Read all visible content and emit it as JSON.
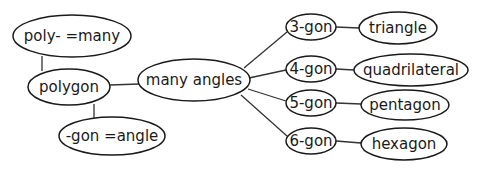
{
  "diagram": {
    "type": "concept-map",
    "nodes": {
      "poly_many": {
        "label": "poly- =many",
        "cx": 72,
        "cy": 36,
        "rx": 59,
        "ry": 21
      },
      "polygon": {
        "label": "polygon",
        "cx": 69,
        "cy": 87,
        "rx": 41,
        "ry": 18
      },
      "gon_angle": {
        "label": "-gon =angle",
        "cx": 112,
        "cy": 136,
        "rx": 53,
        "ry": 19
      },
      "many_angles": {
        "label": "many angles",
        "cx": 194,
        "cy": 80,
        "rx": 56,
        "ry": 21
      },
      "g3": {
        "label": "3-gon",
        "cx": 311,
        "cy": 27,
        "rx": 25,
        "ry": 13
      },
      "g4": {
        "label": "4-gon",
        "cx": 311,
        "cy": 69,
        "rx": 25,
        "ry": 13
      },
      "g5": {
        "label": "5-gon",
        "cx": 311,
        "cy": 103,
        "rx": 25,
        "ry": 13
      },
      "g6": {
        "label": "6-gon",
        "cx": 311,
        "cy": 141,
        "rx": 25,
        "ry": 13
      },
      "triangle": {
        "label": "triangle",
        "cx": 398,
        "cy": 28,
        "rx": 39,
        "ry": 16
      },
      "quadrilateral": {
        "label": "quadrilateral",
        "cx": 411,
        "cy": 70,
        "rx": 57,
        "ry": 16
      },
      "pentagon": {
        "label": "pentagon",
        "cx": 405,
        "cy": 105,
        "rx": 44,
        "ry": 15
      },
      "hexagon": {
        "label": "hexagon",
        "cx": 404,
        "cy": 144,
        "rx": 43,
        "ry": 16
      }
    },
    "edges": [
      {
        "from": "poly_many",
        "to": "polygon"
      },
      {
        "from": "polygon",
        "to": "gon_angle"
      },
      {
        "from": "polygon",
        "to": "many_angles"
      },
      {
        "from": "many_angles",
        "to": "g3"
      },
      {
        "from": "many_angles",
        "to": "g4"
      },
      {
        "from": "many_angles",
        "to": "g5"
      },
      {
        "from": "many_angles",
        "to": "g6"
      },
      {
        "from": "g3",
        "to": "triangle"
      },
      {
        "from": "g4",
        "to": "quadrilateral"
      },
      {
        "from": "g5",
        "to": "pentagon"
      },
      {
        "from": "g6",
        "to": "hexagon"
      }
    ]
  }
}
